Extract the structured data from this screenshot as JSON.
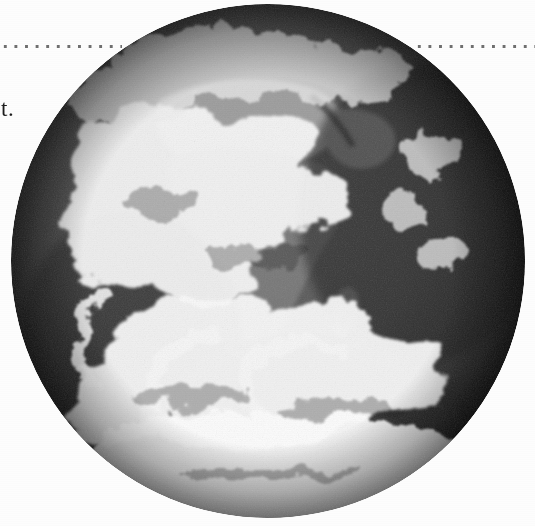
{
  "page": {
    "width": 535,
    "height": 526,
    "background_color": "#fdfdfd",
    "media": "scanned book page"
  },
  "rule": {
    "name": "dotted horizontal rule",
    "style": "dotted",
    "color": "#6f6f6f",
    "dot_diameter_px": 3,
    "dot_pitch_px": 10.6,
    "y_px": 44,
    "left_segment_label": "",
    "right_segment_label": ""
  },
  "text": {
    "body_fragment": "t.",
    "note": "clipped end of a sentence at the left page margin"
  },
  "figure": {
    "name": "earth-satellite-photograph",
    "rendering": "black-and-white halftone photograph",
    "caption": "",
    "center_x_px": 268,
    "center_y_px": 261,
    "diameter_px": 514,
    "colors": {
      "ocean_dark": "#3a3a3a",
      "ocean_mid": "#555555",
      "land_mid": "#8a8a86",
      "land_light": "#a7a49c",
      "cloud_white": "#f2f2f0",
      "limb_shadow": "#242424",
      "polar_cap": "#f6f6f4"
    }
  },
  "features": [
    {
      "name": "africa-landmass",
      "label": "Africa"
    },
    {
      "name": "arabian-peninsula",
      "label": "Arabian Peninsula"
    },
    {
      "name": "madagascar",
      "label": "Madagascar"
    },
    {
      "name": "sahara-bright-region",
      "label": "Sahara"
    },
    {
      "name": "itcz-cloud-band",
      "label": "Equatorial cloud band"
    },
    {
      "name": "southern-cyclone-swirl",
      "label": "Southern Ocean cyclones"
    },
    {
      "name": "antarctic-cloud-cap",
      "label": "Antarctic region"
    }
  ]
}
